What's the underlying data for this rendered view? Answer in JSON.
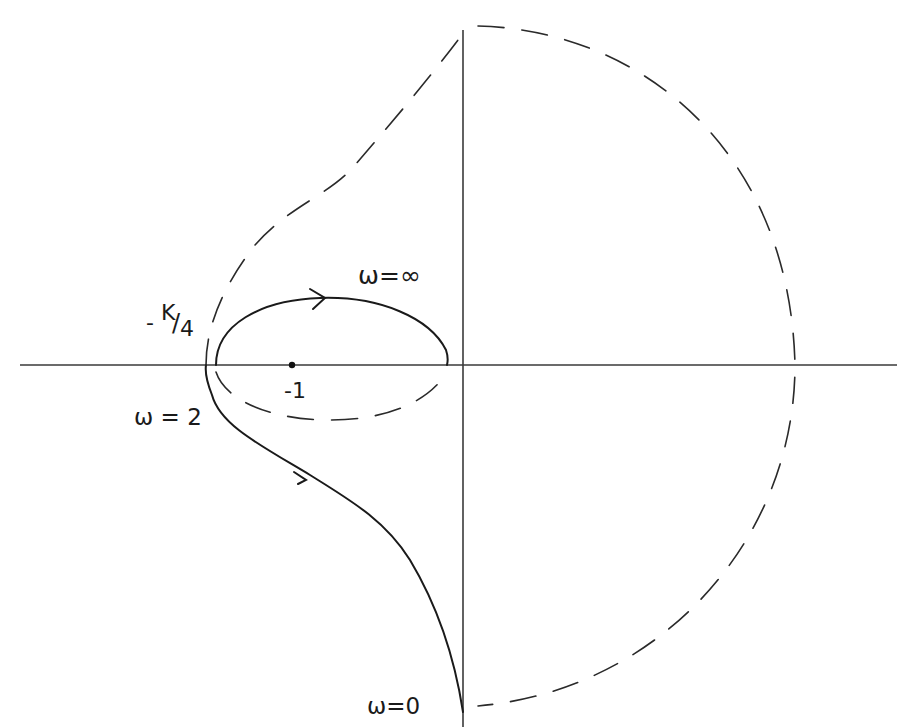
{
  "figure": {
    "type": "Nyquist plot",
    "labels": {
      "omega_inf": "ω=∞",
      "k_over_4": "-K/4",
      "k_over_4_prefix": "-",
      "k_over_4_num": "K",
      "k_over_4_slash": "/",
      "k_over_4_den": "4",
      "minus_one": "-1",
      "omega_2": "ω = 2",
      "omega_0": "ω=0"
    },
    "axes": {
      "real_axis": "horizontal",
      "imag_axis": "vertical",
      "origin_px": [
        463,
        365
      ]
    },
    "points": [
      {
        "name": "critical-point",
        "label": "-1",
        "px": [
          292,
          365
        ]
      }
    ],
    "curves": [
      {
        "name": "solid-contour",
        "style": "solid",
        "description": "from ω=0 at bottom of imaginary axis, up-left through ω=2 near -K/4 crossing, then loop (ω→∞) encircling -1 ending near origin",
        "arrows": 2
      },
      {
        "name": "dashed-mirror-contour",
        "style": "dashed",
        "description": "mirror image (negative frequencies) plus large semicircle closing on right"
      }
    ]
  }
}
